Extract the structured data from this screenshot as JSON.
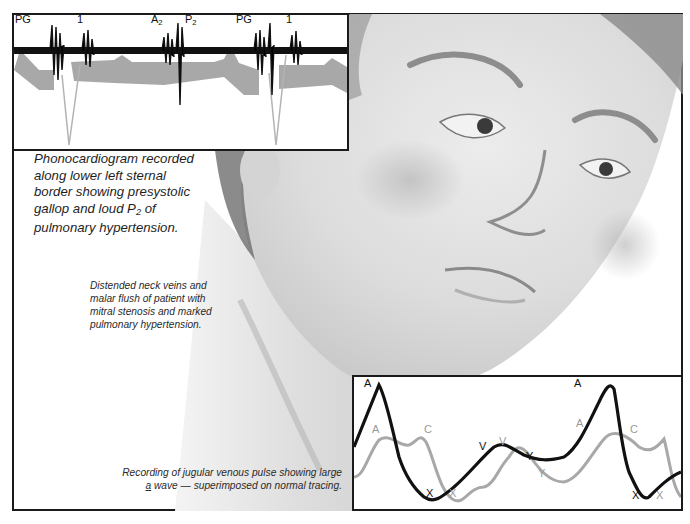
{
  "figure": {
    "phonocardiogram": {
      "labels": [
        {
          "text": "PG",
          "x": 14
        },
        {
          "text": "1",
          "x": 75
        },
        {
          "text": "A",
          "sub": "2",
          "x": 149
        },
        {
          "text": "P",
          "sub": "2",
          "x": 183
        },
        {
          "text": "PG",
          "x": 235
        },
        {
          "text": "1",
          "x": 284
        }
      ],
      "caption": {
        "line1": "Phonocardiogram recorded",
        "line2": "along lower left sternal",
        "line3": "border showing presystolic",
        "line4_pre": "gallop and loud P",
        "line4_sub": "2",
        "line4_post": " of",
        "line5": "pulmonary hypertension."
      }
    },
    "neck_caption": {
      "line1": "Distended neck veins and",
      "line2": "malar flush of patient with",
      "line3": "mitral stenosis and marked",
      "line4": "pulmonary hypertension."
    },
    "jvp": {
      "caption": {
        "line1": "Recording of jugular venous pulse showing large",
        "line2_underlined": "a",
        "line2_rest": " wave — superimposed on normal tracing."
      },
      "abnormal_labels": {
        "a1": "A",
        "v": "V",
        "y": "Y",
        "x1": "X",
        "a2": "A",
        "x2": "X"
      },
      "normal_labels": {
        "a1": "A",
        "c1": "C",
        "v": "V",
        "x1": "X",
        "y": "Y",
        "a2": "A",
        "c2": "C",
        "x2": "X"
      },
      "colors": {
        "abnormal": "#111111",
        "normal": "#a8a8a8"
      }
    }
  }
}
